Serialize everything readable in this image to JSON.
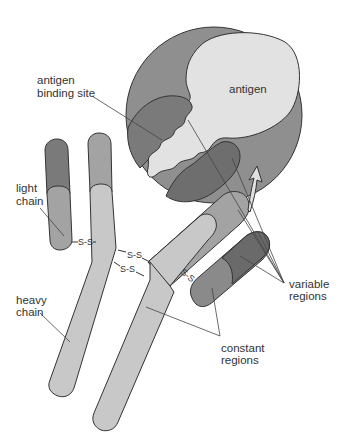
{
  "diagram": {
    "labels": {
      "antigen": "antigen",
      "antigen_binding_site_line1": "antigen",
      "antigen_binding_site_line2": "binding site",
      "light_chain_line1": "light",
      "light_chain_line2": "chain",
      "heavy_chain_line1": "heavy",
      "heavy_chain_line2": "chain",
      "variable_regions_line1": "variable",
      "variable_regions_line2": "regions",
      "constant_regions_line1": "constant",
      "constant_regions_line2": "regions"
    },
    "bonds": {
      "ss1": "S-S",
      "ss2": "S-S",
      "ss3": "S-S",
      "ss4": "S-S"
    },
    "colors": {
      "circle_bg": "#8f8f8f",
      "antigen": "#e2e2e2",
      "variable_dark": "#6e6e6e",
      "variable_mid": "#8a8a8a",
      "constant_light": "#c8c8c8",
      "constant_mid": "#a3a3a3",
      "outline": "#333333"
    }
  }
}
